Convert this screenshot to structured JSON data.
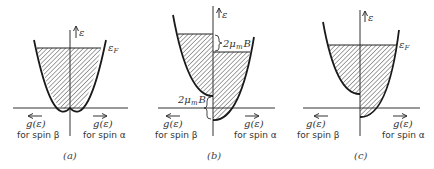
{
  "figure": {
    "panels": [
      {
        "id": "a",
        "caption": "(a)",
        "energy_axis_label": "ε",
        "fermi_label": "ε",
        "fermi_sub": "F",
        "left_label_line1": "g(ε)",
        "left_label_line2": "for spin β",
        "right_label_line1": "g(ε)",
        "right_label_line2": "for spin α"
      },
      {
        "id": "b",
        "caption": "(b)",
        "energy_axis_label": "ε",
        "upper_gap_label": "2μ",
        "upper_gap_sub": "m",
        "upper_gap_tail": "B",
        "lower_gap_label": "2μ",
        "lower_gap_sub": "m",
        "lower_gap_tail": "B",
        "left_label_line1": "g(ε)",
        "left_label_line2": "for spin β",
        "right_label_line1": "g(ε)",
        "right_label_line2": "for spin α"
      },
      {
        "id": "c",
        "caption": "(c)",
        "energy_axis_label": "ε",
        "fermi_label": "ε",
        "fermi_sub": "F",
        "left_label_line1": "g(ε)",
        "left_label_line2": "for spin β",
        "right_label_line1": "g(ε)",
        "right_label_line2": "for spin α"
      }
    ],
    "colors": {
      "line": "#1a1a1a",
      "hatch": "#333333",
      "background": "#ffffff"
    }
  }
}
